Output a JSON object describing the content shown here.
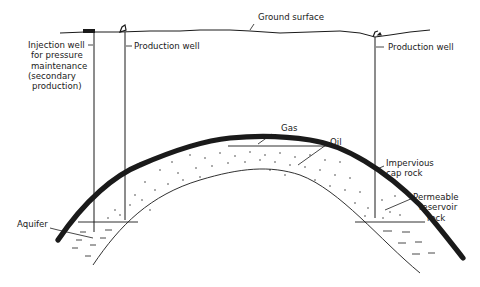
{
  "diagram": {
    "type": "cross-section",
    "labels": {
      "ground_surface": "Ground surface",
      "injection_well": [
        "Injection well",
        "for pressure",
        "maintenance",
        "(secondary",
        "production)"
      ],
      "production_well_left": "Production well",
      "production_well_right": "Production well",
      "gas": "Gas",
      "oil": "Oil",
      "cap_rock": [
        "Impervious",
        "cap rock"
      ],
      "reservoir_rock": [
        "Permeable",
        "reservoir",
        "rock"
      ],
      "aquifer": "Aquifer"
    },
    "colors": {
      "line": "#1a1a1a",
      "background": "#ffffff"
    }
  }
}
